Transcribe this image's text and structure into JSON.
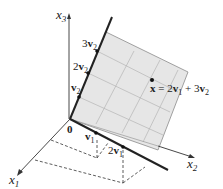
{
  "diagram": {
    "axes": {
      "x1": {
        "label": "x",
        "sub": "1"
      },
      "x2": {
        "label": "x",
        "sub": "2"
      },
      "x3": {
        "label": "x",
        "sub": "3"
      }
    },
    "origin_label": "0",
    "v1_labels": [
      {
        "coef": "",
        "vec": "v",
        "sub": "1"
      },
      {
        "coef": "2",
        "vec": "v",
        "sub": "1"
      }
    ],
    "v2_labels": [
      {
        "coef": "",
        "vec": "v",
        "sub": "2"
      },
      {
        "coef": "2",
        "vec": "v",
        "sub": "2"
      },
      {
        "coef": "3",
        "vec": "v",
        "sub": "2"
      }
    ],
    "point": {
      "name": "x",
      "eq": " = 2",
      "v1": "v",
      "v1_sub": "1",
      "plus": " + 3",
      "v2": "v",
      "v2_sub": "2"
    },
    "colors": {
      "plane_fill": "#e6e6e6",
      "plane_edge": "#8a8a8a",
      "grid": "#b5b5b5",
      "line": "#222222"
    }
  }
}
